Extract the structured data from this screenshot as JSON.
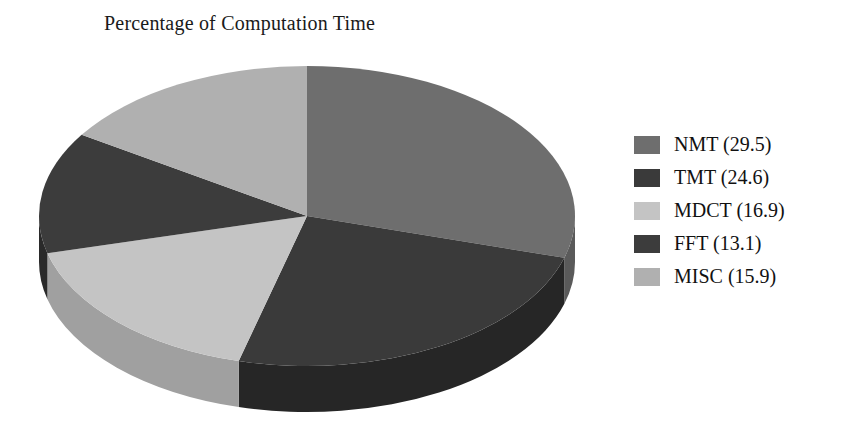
{
  "chart_data": {
    "type": "pie",
    "title": "Percentage of Computation Time",
    "three_d": true,
    "value_unit": "percent",
    "categories": [
      "NMT",
      "TMT",
      "MDCT",
      "FFT",
      "MISC"
    ],
    "values": [
      29.5,
      24.6,
      16.9,
      13.1,
      15.9
    ],
    "labels": [
      "NMT (29.5)",
      "TMT (24.6)",
      "MDCT (16.9)",
      "FFT (13.1)",
      "MISC (15.9)"
    ],
    "slice_colors": [
      "#6e6e6e",
      "#3a3a3a",
      "#c4c4c4",
      "#3c3c3c",
      "#b0b0b0"
    ],
    "slice_side_colors": [
      "#5a5a5a",
      "#262626",
      "#a0a0a0",
      "#2a2a2a",
      "#8e8e8e"
    ],
    "start_angle_deg": 0,
    "direction": "clockwise",
    "legend_position": "right",
    "grid": false,
    "xlabel": "",
    "ylabel": ""
  },
  "header": {
    "title": "Percentage of Computation Time"
  },
  "legend": {
    "items": [
      {
        "label": "NMT (29.5)",
        "name": "NMT",
        "value": 29.5,
        "color": "#6e6e6e"
      },
      {
        "label": "TMT (24.6)",
        "name": "TMT",
        "value": 24.6,
        "color": "#3a3a3a"
      },
      {
        "label": "MDCT (16.9)",
        "name": "MDCT",
        "value": 16.9,
        "color": "#c4c4c4"
      },
      {
        "label": "FFT (13.1)",
        "name": "FFT",
        "value": 13.1,
        "color": "#3c3c3c"
      },
      {
        "label": "MISC (15.9)",
        "name": "MISC",
        "value": 15.9,
        "color": "#b0b0b0"
      }
    ]
  }
}
